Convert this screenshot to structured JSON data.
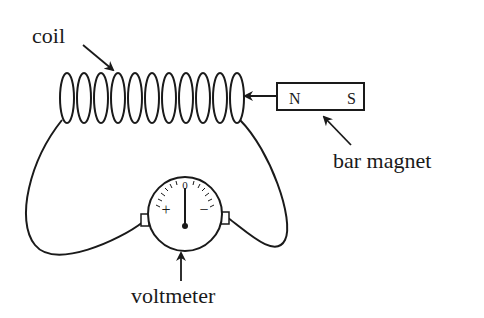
{
  "diagram": {
    "labels": {
      "coil": "coil",
      "magnet": "bar magnet",
      "voltmeter": "voltmeter"
    },
    "magnet": {
      "north": "N",
      "south": "S"
    },
    "voltmeter": {
      "zero": "0",
      "plus": "+",
      "minus": "−"
    },
    "coil_loops": 11,
    "colors": {
      "ink": "#1a1a1a",
      "background": "#ffffff"
    }
  }
}
